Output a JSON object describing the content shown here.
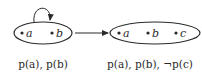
{
  "diagram": {
    "left_state": {
      "elements": [
        "a",
        "b"
      ],
      "caption": "p(a), p(b)",
      "self_loop": true
    },
    "right_state": {
      "elements": [
        "a",
        "b",
        "c"
      ],
      "caption": "p(a), p(b), ¬p(c)"
    },
    "transition": "left_state -> right_state",
    "colors": {
      "stroke": "#2a2a2a",
      "background": "#ffffff"
    }
  }
}
